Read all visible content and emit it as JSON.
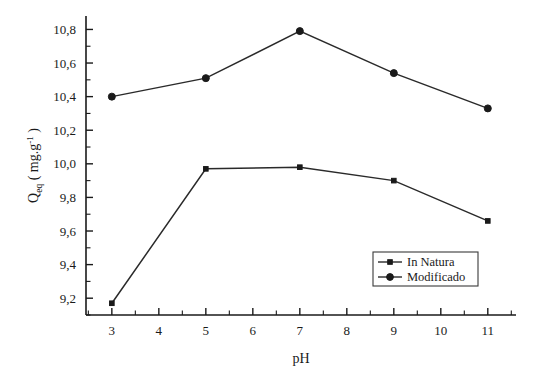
{
  "chart_data": {
    "type": "line",
    "title": "",
    "subtitle": "",
    "xlabel": "pH",
    "ylabel": "Q_eq ( mg.g-1 )",
    "ylabel_parts": {
      "base": "Q",
      "subscript": "eq",
      "open_paren": "(",
      "units": "mg.g",
      "units_exponent": "-1",
      "close_paren": ")"
    },
    "x": [
      3,
      5,
      7,
      9,
      11
    ],
    "series": [
      {
        "name": "In Natura",
        "marker": "square",
        "color": "#1a1a1a",
        "values": [
          9.17,
          9.97,
          9.98,
          9.9,
          9.66
        ]
      },
      {
        "name": "Modificado",
        "marker": "circle",
        "color": "#1a1a1a",
        "values": [
          10.4,
          10.51,
          10.79,
          10.54,
          10.33
        ]
      }
    ],
    "xlim": [
      2.45,
      11.6
    ],
    "ylim": [
      9.1,
      10.88
    ],
    "xticks": [
      3,
      4,
      5,
      6,
      7,
      8,
      9,
      10,
      11
    ],
    "xtick_labels": [
      "3",
      "4",
      "5",
      "6",
      "7",
      "8",
      "9",
      "10",
      "11"
    ],
    "yticks": [
      9.2,
      9.4,
      9.6,
      9.8,
      10.0,
      10.2,
      10.4,
      10.6,
      10.8
    ],
    "ytick_labels": [
      "9,2",
      "9,4",
      "9,6",
      "9,8",
      "10,0",
      "10,2",
      "10,4",
      "10,6",
      "10,8"
    ],
    "y_minor_step": 0.1,
    "grid": false,
    "legend_position": "lower-right",
    "legend_entries": [
      "In Natura",
      "Modificado"
    ],
    "decimal_separator": "comma",
    "background_color": "#ffffff",
    "axis_color": "#1a1a1a"
  }
}
